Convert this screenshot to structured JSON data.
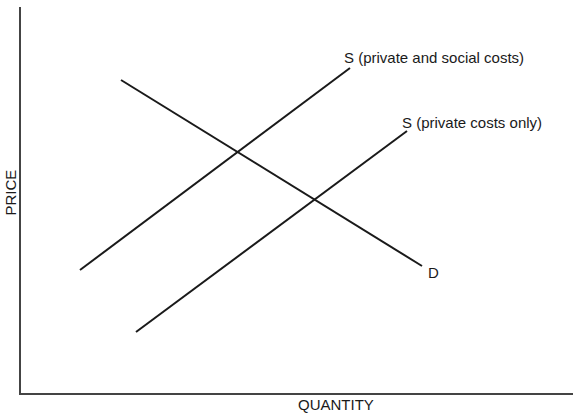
{
  "chart_data": {
    "type": "line",
    "title": "",
    "xlabel": "QUANTITY",
    "ylabel": "PRICE",
    "grid": false,
    "ticks": false,
    "series": [
      {
        "name": "S (private and social costs)",
        "label": "S (private and social costs)",
        "x1": 80,
        "y1": 270,
        "x2": 350,
        "y2": 68
      },
      {
        "name": "S (private costs only)",
        "label": "S (private costs only)",
        "x1": 136,
        "y1": 332,
        "x2": 407,
        "y2": 131
      },
      {
        "name": "D",
        "label": "D",
        "x1": 121,
        "y1": 80,
        "x2": 422,
        "y2": 266
      }
    ],
    "intersections": [
      {
        "between": [
          "D",
          "S (private and social costs)"
        ],
        "x": 237,
        "y": 152
      },
      {
        "between": [
          "D",
          "S (private costs only)"
        ],
        "x": 313,
        "y": 199
      }
    ]
  },
  "labels": {
    "supply_social": "S (private and social costs)",
    "supply_private": "S (private costs only)",
    "demand": "D",
    "y_axis": "PRICE",
    "x_axis": "QUANTITY"
  },
  "colors": {
    "axis": "#444444",
    "line": "#1a1a1a",
    "text": "#1a1a1a",
    "background": "#ffffff"
  }
}
